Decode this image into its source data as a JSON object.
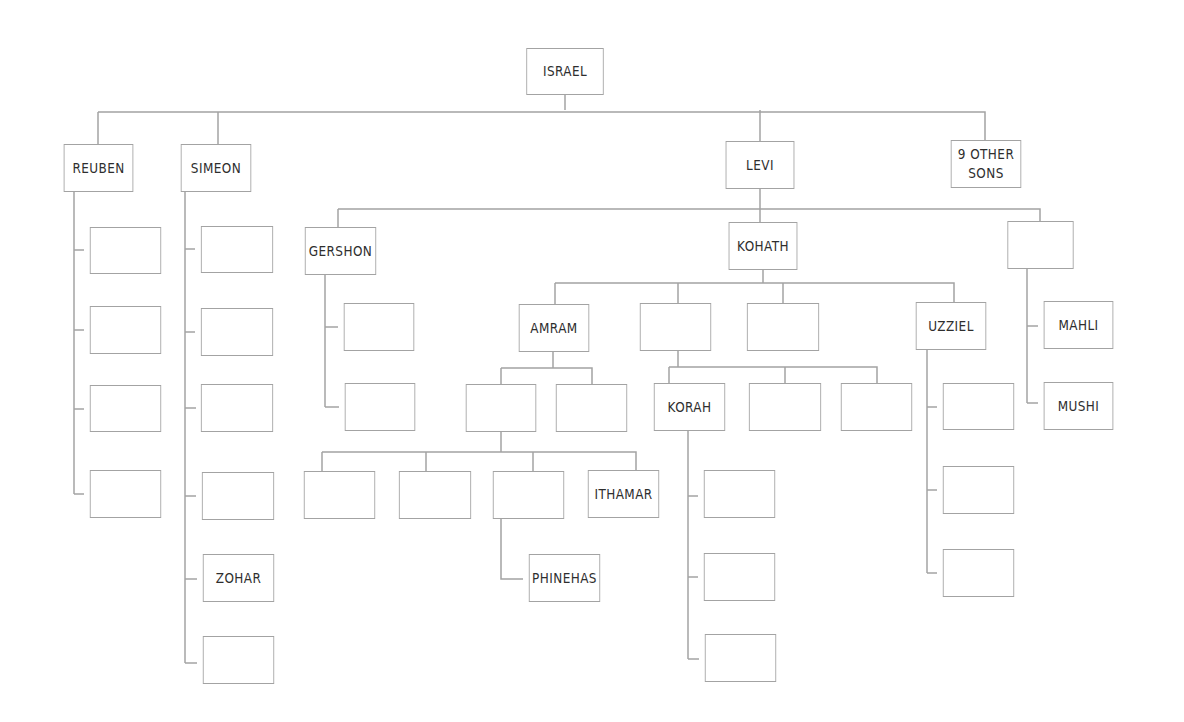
{
  "diagram": {
    "type": "family-tree",
    "line_color": "#a3a3a3",
    "text_color": "#2e2e2e",
    "nodes": [
      {
        "id": "israel",
        "label": "ISRAEL",
        "x": 520,
        "y": 48,
        "w": 90,
        "h": 47
      },
      {
        "id": "reuben",
        "label": "REUBEN",
        "x": 58,
        "y": 144,
        "w": 81,
        "h": 48
      },
      {
        "id": "simeon",
        "label": "SIMEON",
        "x": 175,
        "y": 144,
        "w": 82,
        "h": 48
      },
      {
        "id": "levi",
        "label": "LEVI",
        "x": 720,
        "y": 141,
        "w": 80,
        "h": 48
      },
      {
        "id": "other-sons",
        "label": "9 OTHER\nSONS",
        "x": 945,
        "y": 140,
        "w": 82,
        "h": 48
      },
      {
        "id": "reuben-1",
        "label": "",
        "x": 84,
        "y": 227,
        "w": 83,
        "h": 47
      },
      {
        "id": "reuben-2",
        "label": "",
        "x": 84,
        "y": 306,
        "w": 83,
        "h": 48
      },
      {
        "id": "reuben-3",
        "label": "",
        "x": 84,
        "y": 385,
        "w": 83,
        "h": 47
      },
      {
        "id": "reuben-4",
        "label": "",
        "x": 84,
        "y": 470,
        "w": 83,
        "h": 48
      },
      {
        "id": "simeon-1",
        "label": "",
        "x": 195,
        "y": 226,
        "w": 84,
        "h": 47
      },
      {
        "id": "simeon-2",
        "label": "",
        "x": 195,
        "y": 308,
        "w": 84,
        "h": 48
      },
      {
        "id": "simeon-3",
        "label": "",
        "x": 195,
        "y": 384,
        "w": 84,
        "h": 48
      },
      {
        "id": "simeon-4",
        "label": "",
        "x": 196,
        "y": 472,
        "w": 84,
        "h": 48
      },
      {
        "id": "zohar",
        "label": "ZOHAR",
        "x": 197,
        "y": 554,
        "w": 83,
        "h": 48
      },
      {
        "id": "simeon-6",
        "label": "",
        "x": 197,
        "y": 636,
        "w": 83,
        "h": 48
      },
      {
        "id": "gershon",
        "label": "GERSHON",
        "x": 299,
        "y": 227,
        "w": 83,
        "h": 48
      },
      {
        "id": "gershon-1",
        "label": "",
        "x": 338,
        "y": 303,
        "w": 82,
        "h": 48
      },
      {
        "id": "gershon-2",
        "label": "",
        "x": 339,
        "y": 383,
        "w": 82,
        "h": 48
      },
      {
        "id": "kohath",
        "label": "KOHATH",
        "x": 723,
        "y": 222,
        "w": 80,
        "h": 48
      },
      {
        "id": "merari",
        "label": "",
        "x": 1002,
        "y": 221,
        "w": 77,
        "h": 48
      },
      {
        "id": "mahli",
        "label": "MAHLI",
        "x": 1038,
        "y": 301,
        "w": 81,
        "h": 48
      },
      {
        "id": "mushi",
        "label": "MUSHI",
        "x": 1038,
        "y": 382,
        "w": 81,
        "h": 48
      },
      {
        "id": "amram",
        "label": "AMRAM",
        "x": 513,
        "y": 304,
        "w": 82,
        "h": 48
      },
      {
        "id": "izhar",
        "label": "",
        "x": 634,
        "y": 303,
        "w": 83,
        "h": 48
      },
      {
        "id": "hebron",
        "label": "",
        "x": 741,
        "y": 303,
        "w": 84,
        "h": 48
      },
      {
        "id": "uzziel",
        "label": "UZZIEL",
        "x": 910,
        "y": 302,
        "w": 82,
        "h": 48
      },
      {
        "id": "amram-1",
        "label": "",
        "x": 460,
        "y": 384,
        "w": 82,
        "h": 48
      },
      {
        "id": "amram-2",
        "label": "",
        "x": 550,
        "y": 384,
        "w": 83,
        "h": 48
      },
      {
        "id": "aaron-1",
        "label": "",
        "x": 298,
        "y": 471,
        "w": 83,
        "h": 48
      },
      {
        "id": "aaron-2",
        "label": "",
        "x": 393,
        "y": 471,
        "w": 84,
        "h": 48
      },
      {
        "id": "aaron-3",
        "label": "",
        "x": 487,
        "y": 471,
        "w": 83,
        "h": 48
      },
      {
        "id": "ithamar",
        "label": "ITHAMAR",
        "x": 582,
        "y": 470,
        "w": 83,
        "h": 48
      },
      {
        "id": "phinehas",
        "label": "PHINEHAS",
        "x": 523,
        "y": 554,
        "w": 83,
        "h": 48
      },
      {
        "id": "korah",
        "label": "KORAH",
        "x": 648,
        "y": 383,
        "w": 83,
        "h": 48
      },
      {
        "id": "izhar-2",
        "label": "",
        "x": 743,
        "y": 383,
        "w": 84,
        "h": 48
      },
      {
        "id": "izhar-3",
        "label": "",
        "x": 835,
        "y": 383,
        "w": 83,
        "h": 48
      },
      {
        "id": "korah-1",
        "label": "",
        "x": 698,
        "y": 470,
        "w": 83,
        "h": 48
      },
      {
        "id": "korah-2",
        "label": "",
        "x": 698,
        "y": 553,
        "w": 83,
        "h": 48
      },
      {
        "id": "korah-3",
        "label": "",
        "x": 699,
        "y": 634,
        "w": 83,
        "h": 48
      },
      {
        "id": "uzziel-1",
        "label": "",
        "x": 937,
        "y": 383,
        "w": 83,
        "h": 47
      },
      {
        "id": "uzziel-2",
        "label": "",
        "x": 937,
        "y": 466,
        "w": 83,
        "h": 48
      },
      {
        "id": "uzziel-3",
        "label": "",
        "x": 937,
        "y": 549,
        "w": 83,
        "h": 48
      }
    ],
    "connectors": [
      "M565 95 V110",
      "M98 112 H985 V140",
      "M98 112 V144",
      "M218 112 V144",
      "M760 110 V141",
      "M74 192 V494",
      "M74 250 H84",
      "M74 330 H84",
      "M74 409 H84",
      "M74 494 H84",
      "M185 192 V663",
      "M185 249 H195",
      "M185 332 H195",
      "M185 408 H196",
      "M185 496 H196",
      "M185 579 H197",
      "M185 663 H197",
      "M760 189 V222",
      "M338 209 H1040 V221",
      "M338 209 V227",
      "M325 275 V407",
      "M325 327 H338",
      "M325 407 H339",
      "M1027 269 V403",
      "M1027 326 H1038",
      "M1027 403 H1038",
      "M763 270 V283",
      "M555 283 H954 V302",
      "M555 283 V304",
      "M678 283 V303",
      "M783 283 V303",
      "M553 352 V368",
      "M501 368 H592 V384",
      "M501 368 V384",
      "M501 432 V452",
      "M322 452 H636 V470",
      "M322 452 V471",
      "M426 452 V471",
      "M533 452 V471",
      "M501 519 V579 H523",
      "M678 351 V367",
      "M669 367 H877 V383",
      "M669 367 V383",
      "M785 367 V383",
      "M688 431 V659",
      "M688 496 H698",
      "M688 577 H698",
      "M688 659 H699",
      "M927 350 V573",
      "M927 407 H937",
      "M927 490 H937",
      "M927 573 H937"
    ]
  }
}
